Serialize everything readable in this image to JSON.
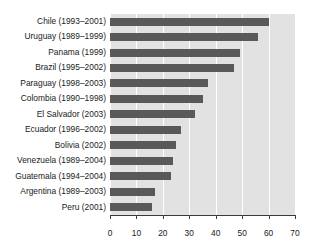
{
  "chart_data": {
    "type": "bar",
    "orientation": "horizontal",
    "title": "",
    "subtitle": "",
    "xlabel": "",
    "ylabel": "",
    "xlim": [
      0,
      70
    ],
    "ylim": null,
    "xticks": [
      0,
      10,
      20,
      30,
      40,
      50,
      60,
      70
    ],
    "xtick_labels": [
      "0",
      "10",
      "20",
      "30",
      "40",
      "50",
      "60",
      "70"
    ],
    "grid": "vertical-white-gridlines",
    "legend": null,
    "legend_position": "none",
    "annotations": [],
    "categories": [
      "Chile (1993–2001)",
      "Uruguay (1989–1999)",
      "Panama (1999)",
      "Brazil (1995–2002)",
      "Paraguay (1998–2003)",
      "Colombia (1990–1998)",
      "El Salvador (2003)",
      "Ecuador (1996–2002)",
      "Bolivia (2002)",
      "Venezuela (1989–2004)",
      "Guatemala (1994–2004)",
      "Argentina (1989–2003)",
      "Peru (2001)"
    ],
    "values": [
      60,
      56,
      49,
      47,
      37,
      35,
      32,
      27,
      25,
      24,
      23,
      17,
      16
    ],
    "colors": {
      "bar": "#595959",
      "plot_background": "#e2e2e2",
      "gridline": "#ffffff",
      "axis": "#3a3a3a",
      "text": "#1a1a1a",
      "figure_background": "#ffffff"
    }
  }
}
